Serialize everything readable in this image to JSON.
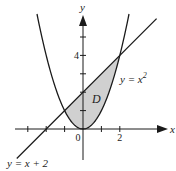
{
  "chart_data": {
    "type": "line",
    "title": "",
    "xlabel": "x",
    "ylabel": "y",
    "xlim": [
      -3.6,
      4.8
    ],
    "ylim": [
      -1.7,
      6.2
    ],
    "x_ticks": [
      -3,
      -2,
      -1,
      0,
      1,
      2
    ],
    "y_ticks": [
      1,
      2,
      3,
      4,
      5
    ],
    "x_tick_labels": [
      {
        "value": 0,
        "label": "0"
      },
      {
        "value": 2,
        "label": "2"
      }
    ],
    "y_tick_labels": [
      {
        "value": 4,
        "label": "4"
      }
    ],
    "grid": false,
    "series": [
      {
        "name": "y = x^2",
        "kind": "parabola",
        "a": 1,
        "b": 0,
        "c": 0,
        "x_range": [
          -2.5,
          2.5
        ],
        "label": "y = x",
        "label_sup": "2"
      },
      {
        "name": "y = x + 2",
        "kind": "linear",
        "m": 1,
        "b": 2,
        "x_range": [
          -3.6,
          4.0
        ],
        "label": "y = x + 2"
      }
    ],
    "shaded_region": {
      "name": "D",
      "label": "D",
      "between": [
        "y = x + 2",
        "y = x^2"
      ],
      "x_range": [
        -1,
        2
      ],
      "fill": "#d0d0d0"
    },
    "intersections": [
      [
        -1,
        1
      ],
      [
        2,
        4
      ]
    ],
    "colors": {
      "curve": "#1a1a1a",
      "axis": "#1a1a1a",
      "fill": "#d0d0d0"
    }
  }
}
